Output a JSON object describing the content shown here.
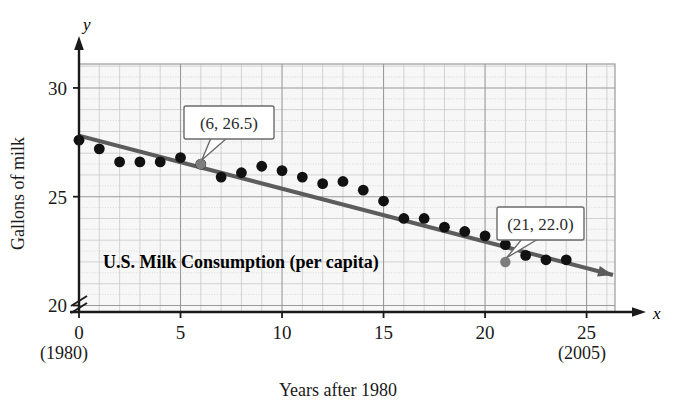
{
  "figure": {
    "caption": "U.S. Milk Consumption (per capita)",
    "x_axis_title": "Years after 1980",
    "y_axis_title": "Gallons of milk",
    "x_axis_letter": "x",
    "y_axis_letter": "y",
    "x_start_year_note": "(1980)",
    "x_end_year_note": "(2005)",
    "annotations": [
      {
        "label": "(6, 26.5)",
        "x": 6,
        "y": 26.5
      },
      {
        "label": "(21, 22.0)",
        "x": 21,
        "y": 22.0
      }
    ],
    "colors": {
      "trend_line": "#5c5c5c",
      "data_point": "#111111",
      "grid_minor": "#c9c9c9",
      "grid_major": "#9a9a9a",
      "plot_background": "#f7f7f7",
      "axis": "#1a1a1a",
      "callout_border": "#6b6b6b"
    }
  },
  "chart_data": {
    "type": "scatter",
    "title": "U.S. Milk Consumption (per capita)",
    "xlabel": "Years after 1980",
    "ylabel": "Gallons of milk",
    "xlim": [
      0,
      26.4
    ],
    "ylim": [
      19.7,
      31.1
    ],
    "y_axis_break": true,
    "grid": true,
    "legend": "none",
    "x_ticks": [
      0,
      5,
      10,
      15,
      20,
      25
    ],
    "x_tick_labels": [
      "0",
      "5",
      "10",
      "15",
      "20",
      "25"
    ],
    "y_ticks": [
      20,
      25,
      30
    ],
    "y_tick_labels": [
      "20",
      "25",
      "30"
    ],
    "x_tick_notes": {
      "0": "(1980)",
      "25": "(2005)"
    },
    "series": [
      {
        "name": "Gallons of milk per capita",
        "type": "scatter",
        "x": [
          0,
          1,
          2,
          3,
          4,
          5,
          6,
          7,
          8,
          9,
          10,
          11,
          12,
          13,
          14,
          15,
          16,
          17,
          18,
          19,
          20,
          21,
          22,
          23,
          24
        ],
        "y": [
          27.6,
          27.2,
          26.6,
          26.6,
          26.6,
          26.8,
          26.5,
          25.9,
          26.1,
          26.4,
          26.2,
          25.9,
          25.6,
          25.7,
          25.3,
          24.8,
          24.0,
          24.0,
          23.6,
          23.4,
          23.2,
          22.8,
          22.3,
          22.1,
          22.1
        ]
      },
      {
        "name": "Linear trend line",
        "type": "line",
        "points": [
          {
            "x": 0,
            "y": 27.8
          },
          {
            "x": 26.3,
            "y": 21.4
          }
        ],
        "through": [
          {
            "x": 6,
            "y": 26.5
          },
          {
            "x": 21,
            "y": 22.0
          }
        ],
        "arrow_end": true
      }
    ]
  }
}
